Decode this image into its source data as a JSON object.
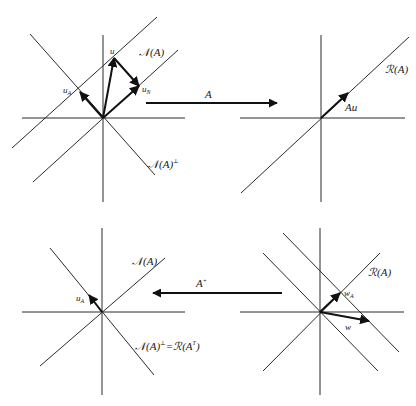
{
  "figure": {
    "colors": {
      "line": "#2a2a2a",
      "vector": "#111111",
      "background": "#ffffff"
    },
    "panels": {
      "top_left": {
        "origin": [
          103,
          118
        ],
        "labels": {
          "u": "u",
          "u_A": "u",
          "u_A_sub": "A",
          "u_N": "u",
          "u_N_sub": "N",
          "null_space": "𝒩(A)",
          "null_perp": "𝒩(A)",
          "null_perp_sup": "⊥"
        }
      },
      "top_right": {
        "origin": [
          321,
          118
        ],
        "labels": {
          "range": "ℛ(A)",
          "Au": "Au"
        }
      },
      "bottom_left": {
        "origin": [
          102,
          312
        ],
        "labels": {
          "null_space": "𝒩(A)",
          "u_A": "u",
          "u_A_sub": "A",
          "null_perp_eq_range_T": "𝒩(A)",
          "null_perp_sup": "⊥",
          "equals": "=",
          "range_T": "ℛ(A",
          "range_T_sup": "T",
          "range_T_close": ")"
        }
      },
      "bottom_right": {
        "origin": [
          320,
          312
        ],
        "labels": {
          "range": "ℛ(A)",
          "w_A": "w",
          "w_A_sub": "A",
          "w": "w"
        }
      }
    },
    "mappings": {
      "forward": {
        "label": "A",
        "from": "top_left",
        "to": "top_right"
      },
      "inverse": {
        "label": "A",
        "label_sup": "+",
        "from": "bottom_right",
        "to": "bottom_left"
      }
    }
  }
}
